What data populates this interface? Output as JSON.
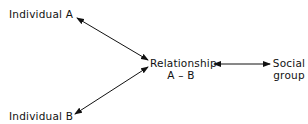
{
  "diagram": {
    "type": "relationship-diagram",
    "nodes": [
      {
        "id": "a",
        "label": "Individual A"
      },
      {
        "id": "b",
        "label": "Individual B"
      },
      {
        "id": "rel",
        "label_line1": "Relationship",
        "label_line2": "A – B"
      },
      {
        "id": "sg",
        "label_line1": "Social",
        "label_line2": "group"
      }
    ],
    "edges": [
      {
        "from": "a",
        "to": "rel",
        "bidirectional": true
      },
      {
        "from": "b",
        "to": "rel",
        "bidirectional": true
      },
      {
        "from": "rel",
        "to": "sg",
        "bidirectional": true
      }
    ],
    "colors": {
      "line": "#111111",
      "background": "#ffffff"
    }
  }
}
